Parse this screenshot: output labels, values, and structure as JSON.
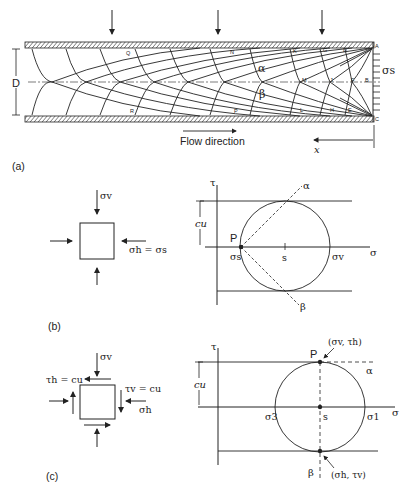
{
  "diagram": {
    "type": "slip-line field and Mohr circle construction",
    "part_a": {
      "panel_label": "(a)",
      "dimension_label": "D",
      "boundary_stress_label": "σs",
      "flow_label": "Flow direction",
      "x_axis_label": "x",
      "slip_line_labels": {
        "alpha": "α",
        "beta": "β"
      },
      "node_labels": {
        "top": [
          "Q",
          "N",
          "K",
          "G",
          "D",
          "A"
        ],
        "center": [
          "M",
          "J",
          "F",
          "B"
        ],
        "bottom": [
          "R",
          "P",
          "L",
          "H",
          "E",
          "C"
        ]
      }
    },
    "part_b": {
      "panel_label": "(b)",
      "element": {
        "top_label": "σv",
        "right_label": "σh = σs"
      },
      "mohr": {
        "tau_axis": "τ",
        "sigma_axis": "σ",
        "cu_label": "cu",
        "pole_label": "P",
        "sigma_s_label": "σs",
        "center_label": "s",
        "sigma_v_label": "σv",
        "alpha_label": "α",
        "beta_label": "β"
      }
    },
    "part_c": {
      "panel_label": "(c)",
      "element": {
        "top_label": "σv",
        "tau_h_label": "τh = cu",
        "tau_v_label": "τv = cu",
        "right_label": "σh"
      },
      "mohr": {
        "tau_axis": "τ",
        "sigma_axis": "σ",
        "cu_label": "cu",
        "pole_label": "P",
        "pole_coords": "(σv, τh)",
        "sigma_3_label": "σ3",
        "center_label": "s",
        "sigma_1_label": "σ1",
        "alpha_label": "α",
        "beta_label": "β",
        "bottom_coords": "(σh, τv)"
      }
    }
  }
}
